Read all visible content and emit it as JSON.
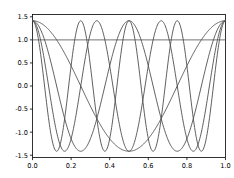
{
  "figure": {
    "width": 234,
    "height": 178,
    "background_color": "#ffffff",
    "plot_background_color": "#ffffff"
  },
  "style": {
    "curve_color": "#4d4d4d",
    "axis_color": "#000000",
    "tick_label_color": "#000000",
    "curve_width": 0.9
  },
  "axes": {
    "x_ticks": [
      "0.0",
      "0.2",
      "0.4",
      "0.6",
      "0.8",
      "1.0"
    ],
    "x_tick_values": [
      0.0,
      0.2,
      0.4,
      0.6,
      0.8,
      1.0
    ],
    "y_ticks": [
      "1.5",
      "1.0",
      "0.5",
      "0.0",
      "-0.5",
      "-1.0",
      "-1.5"
    ],
    "y_tick_values": [
      1.5,
      1.0,
      0.5,
      0.0,
      -0.5,
      -1.0,
      -1.5
    ],
    "xlim": [
      0.0,
      1.0
    ],
    "ylim": [
      -1.55,
      1.55
    ],
    "xlabel": "",
    "ylabel": "",
    "grid": false
  },
  "chart_data": {
    "type": "line",
    "title": "",
    "subtitle": "",
    "xlabel": "",
    "ylabel": "",
    "xlim": [
      0.0,
      1.0
    ],
    "ylim": [
      -1.55,
      1.55
    ],
    "grid": false,
    "legend": null,
    "legend_position": "none",
    "x_ticks": [
      0.0,
      0.2,
      0.4,
      0.6,
      0.8,
      1.0
    ],
    "y_ticks": [
      -1.5,
      -1.0,
      -0.5,
      0.0,
      0.5,
      1.0,
      1.5
    ],
    "amplitude": 1.4142,
    "series": [
      {
        "name": "k=0 constant",
        "form": "1.0",
        "color": "#4d4d4d",
        "x": [
          0.0,
          0.1,
          0.2,
          0.3,
          0.4,
          0.5,
          0.6,
          0.7,
          0.8,
          0.9,
          1.0
        ],
        "values": [
          1.0,
          1.0,
          1.0,
          1.0,
          1.0,
          1.0,
          1.0,
          1.0,
          1.0,
          1.0,
          1.0
        ]
      },
      {
        "name": "k=1 cosine",
        "form": "1.4142*cos(2*pi*x)",
        "color": "#4d4d4d",
        "x": [
          0.0,
          0.05,
          0.1,
          0.15,
          0.2,
          0.25,
          0.3,
          0.35,
          0.4,
          0.45,
          0.5,
          0.55,
          0.6,
          0.65,
          0.7,
          0.75,
          0.8,
          0.85,
          0.9,
          0.95,
          1.0
        ],
        "values": [
          1.414,
          1.345,
          1.144,
          0.831,
          0.437,
          0.0,
          -0.437,
          -0.831,
          -1.144,
          -1.345,
          -1.414,
          -1.345,
          -1.144,
          -0.831,
          -0.437,
          0.0,
          0.437,
          0.831,
          1.144,
          1.345,
          1.414
        ]
      },
      {
        "name": "k=2 cosine",
        "form": "1.4142*cos(4*pi*x)",
        "color": "#4d4d4d",
        "x": [
          0.0,
          0.05,
          0.1,
          0.15,
          0.2,
          0.25,
          0.3,
          0.35,
          0.4,
          0.45,
          0.5,
          0.55,
          0.6,
          0.65,
          0.7,
          0.75,
          0.8,
          0.85,
          0.9,
          0.95,
          1.0
        ],
        "values": [
          1.414,
          1.144,
          0.437,
          -0.437,
          -1.144,
          -1.414,
          -1.144,
          -0.437,
          0.437,
          1.144,
          1.414,
          1.144,
          0.437,
          -0.437,
          -1.144,
          -1.414,
          -1.144,
          -0.437,
          0.437,
          1.144,
          1.414
        ]
      },
      {
        "name": "k=3 cosine",
        "form": "1.4142*cos(6*pi*x)",
        "color": "#4d4d4d",
        "x": [
          0.0,
          0.05,
          0.1,
          0.15,
          0.2,
          0.25,
          0.3,
          0.35,
          0.4,
          0.45,
          0.5,
          0.55,
          0.6,
          0.65,
          0.7,
          0.75,
          0.8,
          0.85,
          0.9,
          0.95,
          1.0
        ],
        "values": [
          1.414,
          0.831,
          -0.437,
          -1.345,
          -1.144,
          0.0,
          1.144,
          1.345,
          0.437,
          -0.831,
          -1.414,
          -0.831,
          0.437,
          1.345,
          1.144,
          0.0,
          -1.144,
          -1.345,
          -0.437,
          0.831,
          1.414
        ]
      },
      {
        "name": "k=4 cosine",
        "form": "1.4142*cos(8*pi*x)",
        "color": "#4d4d4d",
        "x": [
          0.0,
          0.05,
          0.1,
          0.15,
          0.2,
          0.25,
          0.3,
          0.35,
          0.4,
          0.45,
          0.5,
          0.55,
          0.6,
          0.65,
          0.7,
          0.75,
          0.8,
          0.85,
          0.9,
          0.95,
          1.0
        ],
        "values": [
          1.414,
          0.437,
          -1.144,
          -1.144,
          0.437,
          1.414,
          0.437,
          -1.144,
          -1.144,
          0.437,
          1.414,
          0.437,
          -1.144,
          -1.144,
          0.437,
          1.414,
          0.437,
          -1.144,
          -1.144,
          0.437,
          1.414
        ]
      }
    ]
  }
}
